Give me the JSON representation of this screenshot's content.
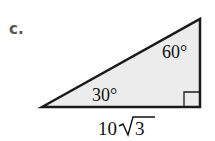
{
  "problem_label": "c.",
  "triangle": {
    "angles": {
      "left": "30°",
      "top": "60°",
      "right": "right-angle"
    },
    "bottom_side": {
      "coefficient": "10",
      "radicand": "3"
    },
    "fill_color": "#ececec",
    "stroke_color": "#1a1a1a"
  }
}
